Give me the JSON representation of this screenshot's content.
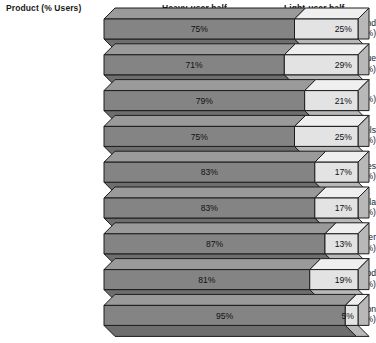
{
  "header": {
    "product_label": "Product (% Users)",
    "heavy_label": "Heavy-user half",
    "light_label": "Light-user half"
  },
  "colors": {
    "heavy_front": "#848484",
    "heavy_top": "#9a9a9a",
    "heavy_bottom": "#6e6e6e",
    "light_front": "#e3e3e3",
    "light_top": "#efefef",
    "light_side": "#b8b8b8",
    "outline": "#1c1c1c",
    "background": "#ffffff",
    "text": "#111111"
  },
  "chart_data": {
    "type": "bar",
    "subtype": "stacked-100-percent-3d",
    "title": "",
    "xlabel": "",
    "ylabel": "",
    "xlim": [
      0,
      100
    ],
    "grid": false,
    "legend_position": "top",
    "categories": [
      "Soaps and detergents (94%)",
      "Toilet tissue (95%)",
      "Shampoo (94%)",
      "Paper towels (90%)",
      "Cake mixes (74%)",
      "Cola (67%)",
      "Beer (41%)",
      "Dog food (30%)",
      "Bourbon (20%)"
    ],
    "series": [
      {
        "name": "Heavy-user half",
        "values": [
          75,
          71,
          79,
          75,
          83,
          83,
          87,
          81,
          95
        ],
        "labels": [
          "75%",
          "71%",
          "79%",
          "75%",
          "83%",
          "83%",
          "87%",
          "81%",
          "95%"
        ]
      },
      {
        "name": "Light-user half",
        "values": [
          25,
          29,
          21,
          25,
          17,
          17,
          13,
          19,
          5
        ],
        "labels": [
          "25%",
          "29%",
          "21%",
          "25%",
          "17%",
          "17%",
          "13%",
          "19%",
          "5%"
        ]
      }
    ],
    "rows": [
      {
        "product": "Soaps and",
        "product_line2": "detergents (94%)",
        "user_pct": 94,
        "heavy": 75,
        "light": 25,
        "heavy_label": "75%",
        "light_label": "25%"
      },
      {
        "product": "Toilet tissue",
        "product_line2": "(95%)",
        "user_pct": 95,
        "heavy": 71,
        "light": 29,
        "heavy_label": "71%",
        "light_label": "29%"
      },
      {
        "product": "Shampoo (94%)",
        "product_line2": "",
        "user_pct": 94,
        "heavy": 79,
        "light": 21,
        "heavy_label": "79%",
        "light_label": "21%"
      },
      {
        "product": "Paper towels",
        "product_line2": "(90%)",
        "user_pct": 90,
        "heavy": 75,
        "light": 25,
        "heavy_label": "75%",
        "light_label": "25%"
      },
      {
        "product": "Cake mixes",
        "product_line2": "(74%)",
        "user_pct": 74,
        "heavy": 83,
        "light": 17,
        "heavy_label": "83%",
        "light_label": "17%"
      },
      {
        "product": "Cola",
        "product_line2": "(67%)",
        "user_pct": 67,
        "heavy": 83,
        "light": 17,
        "heavy_label": "83%",
        "light_label": "17%"
      },
      {
        "product": "Beer",
        "product_line2": "(41%)",
        "user_pct": 41,
        "heavy": 87,
        "light": 13,
        "heavy_label": "87%",
        "light_label": "13%"
      },
      {
        "product": "Dog food",
        "product_line2": "(30%)",
        "user_pct": 30,
        "heavy": 81,
        "light": 19,
        "heavy_label": "81%",
        "light_label": "19%"
      },
      {
        "product": "Bourbon",
        "product_line2": "(20%)",
        "user_pct": 20,
        "heavy": 95,
        "light": 5,
        "heavy_label": "95%",
        "light_label": "5%"
      }
    ]
  }
}
